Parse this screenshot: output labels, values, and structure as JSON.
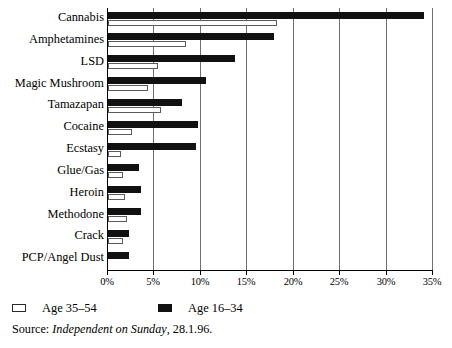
{
  "chart_data": {
    "type": "bar",
    "orientation": "horizontal",
    "title": "",
    "xlabel": "",
    "ylabel": "",
    "xlim": [
      0,
      35
    ],
    "xunit": "%",
    "grid": true,
    "legend_position": "bottom-left",
    "categories": [
      "Cannabis",
      "Amphetamines",
      "LSD",
      "Magic Mushroom",
      "Tamazapan",
      "Cocaine",
      "Ecstasy",
      "Glue/Gas",
      "Heroin",
      "Methodone",
      "Crack",
      "PCP/Angel Dust"
    ],
    "series": [
      {
        "name": "Age 16–34",
        "style": "dark",
        "color": "#111111",
        "values": [
          34.0,
          17.9,
          13.7,
          10.5,
          8.0,
          9.7,
          9.5,
          3.3,
          3.5,
          3.5,
          2.3,
          2.3
        ]
      },
      {
        "name": "Age 35–54",
        "style": "light",
        "color": "#ffffff",
        "values": [
          18.2,
          8.4,
          5.4,
          4.3,
          5.7,
          2.6,
          1.4,
          1.6,
          1.8,
          2.0,
          1.6,
          0.0
        ]
      }
    ],
    "xticks": [
      {
        "value": 0,
        "label": "0%"
      },
      {
        "value": 5,
        "label": "5%"
      },
      {
        "value": 10,
        "label": "10%"
      },
      {
        "value": 15,
        "label": "15%"
      },
      {
        "value": 20,
        "label": "20%"
      },
      {
        "value": 25,
        "label": "25%"
      },
      {
        "value": 30,
        "label": "30%"
      },
      {
        "value": 35,
        "label": "35%"
      }
    ]
  },
  "legend": {
    "items": [
      {
        "label": "Age 35–54",
        "style": "light"
      },
      {
        "label": "Age 16–34",
        "style": "dark"
      }
    ]
  },
  "source": {
    "prefix": "Source: ",
    "publication": "Independent on Sunday",
    "suffix": ", 28.1.96."
  }
}
